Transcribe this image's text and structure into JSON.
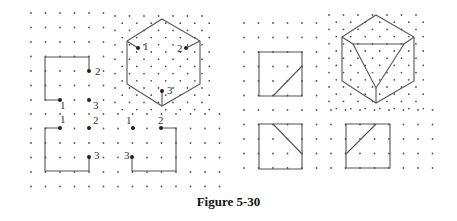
{
  "caption": "Figure 5-30",
  "panels": {
    "left": {
      "description": "Dot-grid patterns with partial shapes and numbered points",
      "labels": {
        "top_left": [
          "1",
          "2",
          "3"
        ],
        "hexagon": [
          "1",
          "2",
          "3"
        ],
        "bottom_left": [
          "1",
          "2",
          "3"
        ],
        "bottom_middle": [
          "1",
          "2",
          "3"
        ]
      }
    },
    "right": {
      "description": "Completed figures: squares with diagonal segments and a hexagon containing an inscribed triangle"
    }
  }
}
